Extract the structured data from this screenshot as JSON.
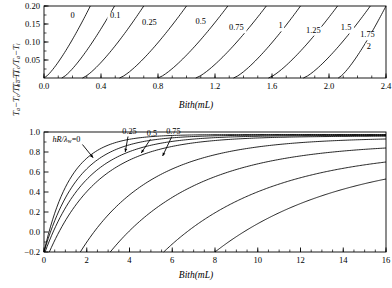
{
  "figure": {
    "background": "#ffffff",
    "line_color": "#000000",
    "panels": [
      "top",
      "bottom"
    ]
  },
  "chart_data": [
    {
      "id": "top",
      "type": "line",
      "title": "",
      "xlabel": "Bith(mL)",
      "ylabel": "Ta-Tc/Ta-Ti",
      "ylabel_parts": {
        "t1": "T",
        "s1": "a",
        "minus1": "−",
        "t2": "T",
        "s2": "c",
        "slash": "/",
        "t3": "T",
        "s3": "a",
        "minus2": "−",
        "t4": "T",
        "s4": "i"
      },
      "xlim": [
        0.0,
        2.4
      ],
      "ylim": [
        0.0,
        0.2
      ],
      "xticks": [
        0.0,
        0.4,
        0.8,
        1.2,
        1.6,
        2.0,
        2.4
      ],
      "xtick_labels": [
        "0.0",
        "0.4",
        "0.8",
        "1.2",
        "1.6",
        "2.0",
        "2.4"
      ],
      "xminor_step": 0.1,
      "yticks": [
        0.05,
        0.1,
        0.15,
        0.2
      ],
      "ytick_labels": [
        "0.05",
        "0.10",
        "0.15",
        "0.20"
      ],
      "grid": false,
      "legend": "inline-contour-labels",
      "curve_parameter": "hR/λw",
      "series": [
        {
          "name": "0",
          "label": "0",
          "label_x": 0.2,
          "label_y": 0.167,
          "x0": 0.0,
          "x_top": 0.325
        },
        {
          "name": "0.1",
          "label": "0.1",
          "label_x": 0.5,
          "label_y": 0.167,
          "x0": 0.125,
          "x_top": 0.495
        },
        {
          "name": "0.25",
          "label": "0.25",
          "label_x": 0.74,
          "label_y": 0.146,
          "x0": 0.27,
          "x_top": 0.7
        },
        {
          "name": "0.5",
          "label": "0.5",
          "label_x": 1.1,
          "label_y": 0.15,
          "x0": 0.53,
          "x_top": 1.0
        },
        {
          "name": "0.75",
          "label": "0.75",
          "label_x": 1.35,
          "label_y": 0.133,
          "x0": 0.8,
          "x_top": 1.29
        },
        {
          "name": "1",
          "label": "1",
          "label_x": 1.66,
          "label_y": 0.138,
          "x0": 1.065,
          "x_top": 1.56
        },
        {
          "name": "1.25",
          "label": "1.25",
          "label_x": 1.89,
          "label_y": 0.126,
          "x0": 1.33,
          "x_top": 1.8
        },
        {
          "name": "1.5",
          "label": "1.5",
          "label_x": 2.12,
          "label_y": 0.132,
          "x0": 1.575,
          "x_top": 2.06
        },
        {
          "name": "1.75",
          "label": "1.75",
          "label_x": 2.27,
          "label_y": 0.113,
          "x0": 1.82,
          "x_top": 2.29
        },
        {
          "name": "2",
          "label": "2",
          "label_x": 2.28,
          "label_y": 0.08,
          "x0": 2.065,
          "x_top": 2.4
        }
      ]
    },
    {
      "id": "bottom",
      "type": "line",
      "title": "",
      "xlabel": "Bith(mL)",
      "ylabel": "Ta-Tc/Ta-Ti",
      "ylabel_parts": {
        "t1": "T",
        "s1": "a",
        "minus1": "−",
        "t2": "T",
        "s2": "c",
        "slash": "/",
        "t3": "T",
        "s3": "a",
        "minus2": "−",
        "t4": "T",
        "s4": "i"
      },
      "xlim": [
        0,
        16
      ],
      "ylim": [
        -0.2,
        1.0
      ],
      "xticks": [
        0,
        2,
        4,
        6,
        8,
        10,
        12,
        14,
        16
      ],
      "xtick_labels": [
        "0",
        "2",
        "4",
        "6",
        "8",
        "10",
        "12",
        "14",
        "16"
      ],
      "xminor_step": 0.5,
      "yticks": [
        -0.2,
        0.0,
        0.2,
        0.4,
        0.6,
        0.8,
        1.0
      ],
      "ytick_labels": [
        "−0.2",
        "0.0",
        "0.2",
        "0.4",
        "0.6",
        "0.8",
        "1.0"
      ],
      "grid": false,
      "legend": "inline-arrow-annotations",
      "curve_parameter": "hR/λw",
      "annotations": [
        {
          "text_prefix": "hR/",
          "text_sub": "w",
          "text_lambda": "λ",
          "text_suffix": "=0",
          "label": "hR/λw=0",
          "text_x": 1.05,
          "text_y": 0.905,
          "arrow_to_x": 2.3,
          "arrow_to_y": 0.742
        },
        {
          "label": "0.25",
          "text_x": 4.0,
          "text_y": 0.985,
          "arrow_to_x": 3.8,
          "arrow_to_y": 0.8
        },
        {
          "label": "0.5",
          "text_x": 5.05,
          "text_y": 0.958,
          "arrow_to_x": 4.55,
          "arrow_to_y": 0.79
        },
        {
          "label": "0.75",
          "text_x": 6.05,
          "text_y": 0.985,
          "arrow_to_x": 5.55,
          "arrow_to_y": 0.76
        }
      ],
      "series": [
        {
          "name": "0",
          "x0": 0.0,
          "k": 0.8,
          "y_end": 0.975
        },
        {
          "name": "0.25",
          "x0": 0.0,
          "k": 0.62,
          "y_end": 0.97
        },
        {
          "name": "0.5",
          "x0": 0.05,
          "k": 0.5,
          "y_end": 0.965
        },
        {
          "name": "0.75",
          "x0": 0.25,
          "k": 0.42,
          "y_end": 0.958
        },
        {
          "name": "1",
          "x0": 1.7,
          "k": 0.3,
          "y_end": 0.93
        },
        {
          "name": "1.5",
          "x0": 3.1,
          "k": 0.24,
          "y_end": 0.84
        },
        {
          "name": "2",
          "x0": 5.6,
          "k": 0.2,
          "y_end": 0.7
        },
        {
          "name": "3",
          "x0": 8.0,
          "k": 0.17,
          "y_end": 0.53
        }
      ]
    }
  ]
}
